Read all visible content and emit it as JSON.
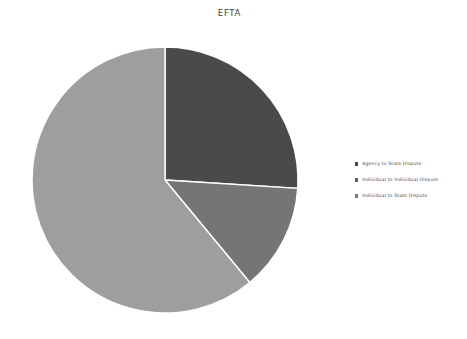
{
  "chart_data": {
    "type": "pie",
    "title": "EFTA",
    "categories": [
      "Agency to State Dispute",
      "Individual to Individual Dispute",
      "Individual to State Dispute"
    ],
    "values": [
      26,
      13,
      61
    ],
    "units": "percent",
    "start_angle_deg": 0,
    "direction": "clockwise",
    "colors": [
      "#4a4a4a",
      "#757575",
      "#9e9e9e"
    ],
    "slice_border_color": "#ffffff",
    "legend_position": "right",
    "grid": false,
    "xlabel": "",
    "ylabel": "",
    "slice_labels": [
      "",
      "",
      ""
    ]
  },
  "chart": {
    "title": "EFTA",
    "background": "#ffffff"
  },
  "legend": {
    "items": [
      {
        "label": "Agency to State Dispute",
        "color": "#4a4a4a"
      },
      {
        "label": "Individual to Individual Dispute",
        "color": "#5f5f5f"
      },
      {
        "label": "Individual to State Dispute",
        "color": "#7a7a7a"
      }
    ]
  }
}
